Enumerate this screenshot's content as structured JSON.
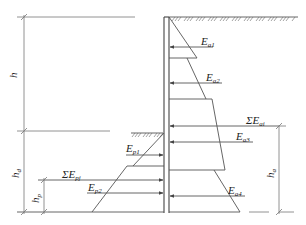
{
  "diagram": {
    "title": "",
    "labels": {
      "h": "h",
      "h_d": "h",
      "h_d_sub": "d",
      "h_p": "h",
      "h_p_sub": "p",
      "h_a": "h",
      "h_a_sub": "a",
      "Ea1": "E",
      "Ea1_sub": "a1",
      "Ea2": "E",
      "Ea2_sub": "a2",
      "Ea3": "E",
      "Ea3_sub": "a3",
      "Ea4": "E",
      "Ea4_sub": "a4",
      "sumEai": "ΣE",
      "sumEai_sub": "ai",
      "Ep1": "E",
      "Ep1_sub": "p1",
      "Ep2": "E",
      "Ep2_sub": "p2",
      "sumEpj": "ΣE",
      "sumEpj_sub": "pj"
    },
    "colors": {
      "line": "#555555",
      "text": "#222222",
      "background": "#ffffff"
    }
  }
}
